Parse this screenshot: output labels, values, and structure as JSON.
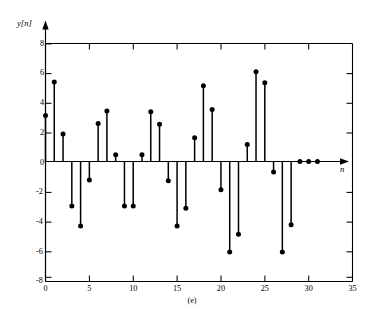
{
  "figure": {
    "caption": "(e)",
    "ylabel": "y[n]",
    "xlabel": "n"
  },
  "chart_data": {
    "type": "scatter",
    "plot_style": "stem",
    "title": "",
    "subtitle": "",
    "caption": "(e)",
    "xlabel": "n",
    "ylabel": "y[n]",
    "xlim": [
      0,
      35
    ],
    "ylim": [
      -8,
      8
    ],
    "xticks": [
      0,
      5,
      10,
      15,
      20,
      25,
      30,
      35
    ],
    "yticks": [
      8,
      6,
      4,
      2,
      0,
      -2,
      -4,
      -6,
      -8
    ],
    "xtick_labels": [
      "0",
      "5",
      "10",
      "15",
      "20",
      "25",
      "30",
      "35"
    ],
    "ytick_labels": [
      "8",
      "6",
      "4",
      "2",
      "0",
      "-2",
      "-4",
      "-6",
      "-8"
    ],
    "grid": false,
    "legend": null,
    "legend_position": "none",
    "marker": "filled-circle",
    "series": [
      {
        "name": "y[n]",
        "x": [
          0,
          1,
          2,
          3,
          4,
          5,
          6,
          7,
          8,
          9,
          10,
          11,
          12,
          13,
          14,
          15,
          16,
          17,
          18,
          19,
          20,
          21,
          22,
          23,
          24,
          25,
          26,
          27,
          28,
          29,
          30,
          31
        ],
        "values": [
          3.1,
          5.35,
          1.85,
          -3.0,
          -4.35,
          -1.25,
          2.55,
          3.4,
          0.45,
          -3.0,
          -3.0,
          0.45,
          3.35,
          2.5,
          -1.3,
          -4.35,
          -3.15,
          1.6,
          5.1,
          3.5,
          -1.9,
          -6.1,
          -4.9,
          1.15,
          6.05,
          5.3,
          -0.7,
          -6.1,
          -4.25,
          0.0,
          0.0,
          0.0
        ]
      }
    ]
  }
}
